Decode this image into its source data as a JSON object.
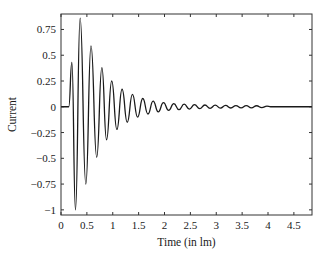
{
  "chart_data": {
    "type": "line",
    "title": "",
    "xlabel": "Time (in lm)",
    "ylabel": "Current",
    "xlim": [
      0,
      4.85
    ],
    "ylim": [
      -1.05,
      0.9
    ],
    "grid": false,
    "legend": null,
    "xticks": [
      0,
      0.5,
      1,
      1.5,
      2,
      2.5,
      3,
      3.5,
      4,
      4.5
    ],
    "xtick_labels": [
      "0",
      "0.5",
      "1",
      "1.5",
      "2",
      "2.5",
      "3",
      "3.5",
      "4",
      "4.5"
    ],
    "yticks": [
      0.75,
      0.5,
      0.25,
      0,
      -0.25,
      -0.5,
      -0.75,
      -1
    ],
    "ytick_labels": [
      "0.75",
      "0.5",
      "0.25",
      "0",
      "−0.25",
      "−0.5",
      "−0.75",
      "−1"
    ],
    "series": [
      {
        "name": "Current",
        "color": "#1a1a1a",
        "x": [
          0,
          0.15,
          0.21,
          0.28,
          0.37,
          0.48,
          0.58,
          0.69,
          0.79,
          0.88,
          0.98,
          1.08,
          1.18,
          1.28,
          1.38,
          1.48,
          1.58,
          1.68,
          1.78,
          1.88,
          1.98,
          2.08,
          2.18,
          2.28,
          2.38,
          2.48,
          2.58,
          2.68,
          2.78,
          2.88,
          2.98,
          3.08,
          3.18,
          3.28,
          3.38,
          3.48,
          3.58,
          3.68,
          3.78,
          3.88,
          3.98,
          4.05,
          4.85
        ],
        "y": [
          0,
          0.0,
          0.43,
          -1.0,
          0.86,
          -0.75,
          0.59,
          -0.49,
          0.38,
          -0.32,
          0.25,
          -0.22,
          0.17,
          -0.15,
          0.12,
          -0.1,
          0.08,
          -0.07,
          0.055,
          -0.05,
          0.04,
          -0.035,
          0.03,
          -0.028,
          0.025,
          -0.022,
          0.02,
          -0.018,
          0.017,
          -0.015,
          0.015,
          -0.013,
          0.013,
          -0.012,
          0.012,
          -0.011,
          0.011,
          -0.01,
          0.01,
          -0.008,
          0.006,
          0,
          0
        ]
      }
    ]
  },
  "axes_box": {
    "left": 61,
    "top": 14,
    "right": 312,
    "bottom": 215
  }
}
